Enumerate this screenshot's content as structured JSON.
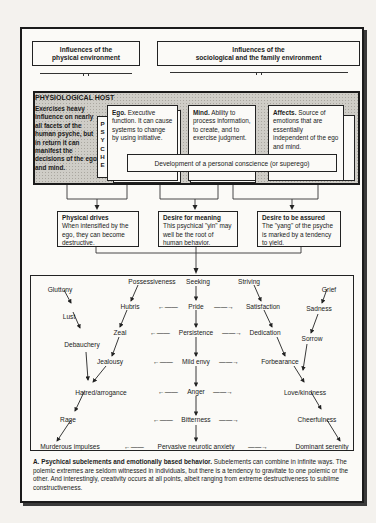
{
  "influences": {
    "physical": [
      "Influences of the",
      "physical environment"
    ],
    "sociological": [
      "Influences of the",
      "sociological and the family environment"
    ]
  },
  "host": {
    "title": "PHYSIOLOGICAL HOST",
    "description": "Exercises heavy influence on nearly all facets of the human psyche, but in return it can manifest the decisions of the ego and mind.",
    "psyche_label": [
      "P",
      "S",
      "Y",
      "C",
      "H",
      "E"
    ]
  },
  "psyche_elements": [
    {
      "title": "Ego.",
      "text": "Executive function. It can cause systems to change by using initiative."
    },
    {
      "title": "Mind.",
      "text": "Ability to process information, to create, and to exercise judgment."
    },
    {
      "title": "Affects.",
      "text": "Source of emotions that are essentially independent of the ego and mind."
    }
  ],
  "conscience": "Development of a personal conscience (or superego)",
  "drives": [
    {
      "title": "Physical drives",
      "text": "When intensified by the ego, they can become destructive."
    },
    {
      "title": "Desire for meaning",
      "text": "This psychical \"yin\" may well be the root of human behavior."
    },
    {
      "title": "Desire to be assured",
      "text": "The \"yang\" of the psyche is marked by a tendency to yield."
    }
  ],
  "flow": {
    "top": [
      "Possessiveness",
      "Seeking",
      "Striving"
    ],
    "left_chain": [
      "Gluttony",
      "Lust",
      "Debauchery",
      "Hatred/arrogance",
      "Rage",
      "Murderous impulses"
    ],
    "left_inner_chain": [
      "Hubris",
      "Zeal",
      "Jealousy"
    ],
    "center_chain": [
      "Pride",
      "Persistence",
      "Mild envy",
      "Anger",
      "Bitterness",
      "Pervasive neurotic anxiety"
    ],
    "right_inner_chain": [
      "Satisfaction",
      "Dedication",
      "Forbearance"
    ],
    "right_chain": [
      "Grief",
      "Sadness",
      "Sorrow",
      "Love/kindness",
      "Cheerfulness",
      "Dominant serenity"
    ],
    "left_arrow": "←——",
    "right_arrow": "——→"
  },
  "caption": {
    "label": "A. Psychical subelements and emotionally based behavior.",
    "text": " Subelements can combine in infinite ways. The polemic extremes are seldom witnessed in individuals, but there is a tendency to gravitate to one polemic or the other. And interestingly, creativity occurs at all points, albeit ranging from extreme destructiveness to sublime constructiveness."
  }
}
